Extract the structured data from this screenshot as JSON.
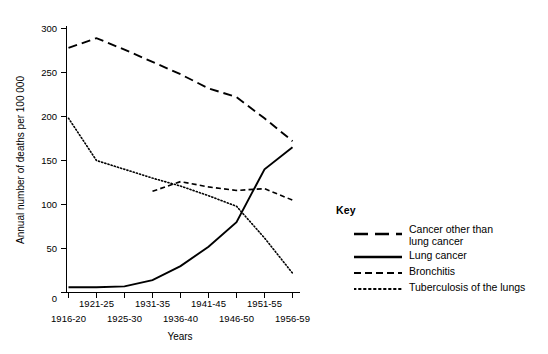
{
  "chart_data": {
    "type": "line",
    "title": "",
    "xlabel": "Years",
    "ylabel": "Annual number of deaths per 100 000",
    "ylim": [
      0,
      300
    ],
    "yticks": [
      0,
      50,
      100,
      150,
      200,
      250,
      300
    ],
    "ytick_labels": [
      "0",
      "50",
      "100",
      "150",
      "200",
      "250",
      "300"
    ],
    "grid": false,
    "legend_position": "right",
    "categories": [
      "1916-20",
      "1921-25",
      "1925-30",
      "1931-35",
      "1936-40",
      "1941-45",
      "1946-50",
      "1951-55",
      "1956-59"
    ],
    "xtick_labels_upper": [
      "1921-25",
      "1931-35",
      "1941-45",
      "1951-55"
    ],
    "xtick_labels_lower": [
      "1916-20",
      "1925-30",
      "1936-40",
      "1946-50",
      "1956-59"
    ],
    "series": [
      {
        "name": "Cancer other than lung cancer",
        "style": "long-dash",
        "color": "#000000",
        "x": [
          "1916-20",
          "1921-25",
          "1925-30",
          "1931-35",
          "1936-40",
          "1941-45",
          "1946-50",
          "1951-55",
          "1956-59"
        ],
        "values": [
          278,
          289,
          276,
          262,
          248,
          232,
          222,
          198,
          172
        ]
      },
      {
        "name": "Lung cancer",
        "style": "solid",
        "color": "#000000",
        "x": [
          "1916-20",
          "1921-25",
          "1925-30",
          "1931-35",
          "1936-40",
          "1941-45",
          "1946-50",
          "1951-55",
          "1956-59"
        ],
        "values": [
          6,
          6,
          7,
          14,
          30,
          52,
          80,
          140,
          165
        ]
      },
      {
        "name": "Bronchitis",
        "style": "dash",
        "color": "#000000",
        "x": [
          "1931-35",
          "1936-40",
          "1941-45",
          "1946-50",
          "1951-55",
          "1956-59"
        ],
        "values": [
          115,
          126,
          120,
          116,
          118,
          105
        ]
      },
      {
        "name": "Tuberculosis of the lungs",
        "style": "dotted",
        "color": "#000000",
        "x": [
          "1916-20",
          "1921-25",
          "1925-30",
          "1931-35",
          "1936-40",
          "1941-45",
          "1946-50",
          "1951-55",
          "1956-59"
        ],
        "values": [
          198,
          150,
          140,
          130,
          121,
          110,
          98,
          62,
          22
        ]
      }
    ]
  },
  "legend": {
    "title": "Key",
    "items": [
      {
        "label": "Cancer other than\nlung cancer",
        "style": "long-dash"
      },
      {
        "label": "Lung cancer",
        "style": "solid"
      },
      {
        "label": "Bronchitis",
        "style": "dash"
      },
      {
        "label": "Tuberculosis of the lungs",
        "style": "dotted"
      }
    ]
  },
  "axis": {
    "ylabel": "Annual number of deaths per 100 000",
    "xlabel": "Years",
    "yticks": [
      "300",
      "250",
      "200",
      "150",
      "100",
      "50",
      "0"
    ],
    "xticks_upper": [
      "1921-25",
      "1931-35",
      "1941-45",
      "1951-55"
    ],
    "xticks_lower": [
      "1916-20",
      "1925-30",
      "1936-40",
      "1946-50",
      "1956-59"
    ]
  },
  "caption_fragment": ""
}
